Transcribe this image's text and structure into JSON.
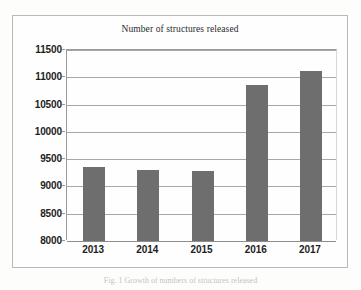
{
  "chart_data": {
    "type": "bar",
    "title": "Number of structures released",
    "xlabel": "",
    "ylabel": "",
    "categories": [
      "2013",
      "2014",
      "2015",
      "2016",
      "2017"
    ],
    "values": [
      9350,
      9310,
      9275,
      10850,
      11120
    ],
    "ylim": [
      8000,
      11500
    ],
    "ytick_step": 500,
    "yticks": [
      "11500",
      "11000",
      "10500",
      "10000",
      "9500",
      "9000",
      "8500",
      "8000"
    ],
    "ytick_values": [
      11500,
      11000,
      10500,
      10000,
      9500,
      9000,
      8500,
      8000
    ],
    "grid": "horizontal",
    "legend": null,
    "series": [
      {
        "name": "Number of structures released",
        "values": [
          9350,
          9310,
          9275,
          10850,
          11120
        ],
        "color": "#6e6e6e"
      }
    ],
    "colors": {
      "bar": "#6e6e6e",
      "gridline": "#a8a8a8",
      "axis": "#9a9a9a",
      "frame": "#b9b9b9",
      "text": "#1d1d1d",
      "background": "#fefefe"
    }
  },
  "caption": {
    "text": "Fig. 1  Growth of numbers of structures released"
  }
}
